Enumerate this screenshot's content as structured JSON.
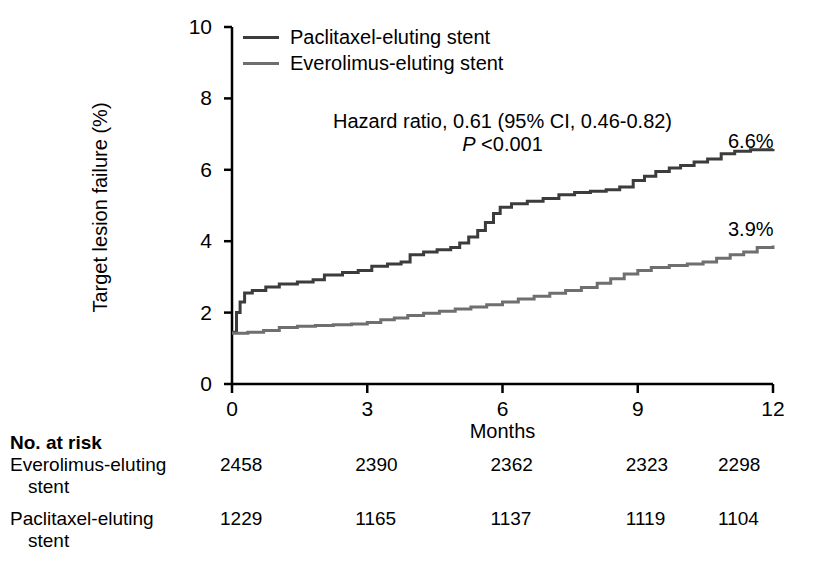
{
  "chart_data": {
    "type": "line",
    "title": "",
    "xlabel": "Months",
    "ylabel": "Target lesion failure (%)",
    "xlim": [
      0,
      12
    ],
    "ylim": [
      0,
      10
    ],
    "xticks": [
      "0",
      "3",
      "6",
      "9",
      "12"
    ],
    "yticks": [
      "0",
      "2",
      "4",
      "6",
      "8",
      "10"
    ],
    "grid": false,
    "legend_position": "top-left",
    "annotations": {
      "hazard_ratio": "Hazard ratio, 0.61 (95% CI, 0.46-0.82)",
      "p_value_italic": "P",
      "p_value_rest": " <0.001"
    },
    "series": [
      {
        "name": "Paclitaxel-eluting stent",
        "color": "#3c3c3c",
        "endpoint_label": "6.6%",
        "endpoint_value": 6.6,
        "points": [
          [
            0.0,
            1.45
          ],
          [
            0.1,
            2.0
          ],
          [
            0.18,
            2.3
          ],
          [
            0.28,
            2.55
          ],
          [
            0.45,
            2.62
          ],
          [
            0.75,
            2.72
          ],
          [
            1.05,
            2.8
          ],
          [
            1.45,
            2.86
          ],
          [
            1.8,
            2.92
          ],
          [
            2.05,
            3.05
          ],
          [
            2.45,
            3.12
          ],
          [
            2.8,
            3.18
          ],
          [
            3.1,
            3.3
          ],
          [
            3.45,
            3.36
          ],
          [
            3.75,
            3.42
          ],
          [
            3.95,
            3.62
          ],
          [
            4.25,
            3.7
          ],
          [
            4.55,
            3.76
          ],
          [
            4.85,
            3.82
          ],
          [
            5.05,
            3.95
          ],
          [
            5.25,
            4.12
          ],
          [
            5.45,
            4.3
          ],
          [
            5.62,
            4.52
          ],
          [
            5.8,
            4.78
          ],
          [
            5.95,
            4.95
          ],
          [
            6.2,
            5.05
          ],
          [
            6.55,
            5.12
          ],
          [
            6.9,
            5.2
          ],
          [
            7.25,
            5.3
          ],
          [
            7.6,
            5.36
          ],
          [
            7.95,
            5.4
          ],
          [
            8.3,
            5.44
          ],
          [
            8.6,
            5.52
          ],
          [
            8.9,
            5.7
          ],
          [
            9.15,
            5.82
          ],
          [
            9.4,
            5.95
          ],
          [
            9.7,
            6.05
          ],
          [
            9.95,
            6.12
          ],
          [
            10.25,
            6.22
          ],
          [
            10.55,
            6.3
          ],
          [
            10.85,
            6.45
          ],
          [
            11.15,
            6.52
          ],
          [
            11.5,
            6.56
          ],
          [
            12.0,
            6.58
          ]
        ]
      },
      {
        "name": "Everolimus-eluting stent",
        "color": "#6f6f6f",
        "endpoint_label": "3.9%",
        "endpoint_value": 3.9,
        "points": [
          [
            0.0,
            1.42
          ],
          [
            0.35,
            1.45
          ],
          [
            0.7,
            1.5
          ],
          [
            1.05,
            1.58
          ],
          [
            1.45,
            1.62
          ],
          [
            1.85,
            1.64
          ],
          [
            2.25,
            1.66
          ],
          [
            2.65,
            1.68
          ],
          [
            3.0,
            1.72
          ],
          [
            3.3,
            1.8
          ],
          [
            3.6,
            1.85
          ],
          [
            3.9,
            1.92
          ],
          [
            4.25,
            1.98
          ],
          [
            4.6,
            2.04
          ],
          [
            4.95,
            2.1
          ],
          [
            5.3,
            2.16
          ],
          [
            5.65,
            2.22
          ],
          [
            6.0,
            2.3
          ],
          [
            6.35,
            2.38
          ],
          [
            6.7,
            2.46
          ],
          [
            7.05,
            2.54
          ],
          [
            7.4,
            2.62
          ],
          [
            7.75,
            2.7
          ],
          [
            8.1,
            2.82
          ],
          [
            8.4,
            2.95
          ],
          [
            8.7,
            3.08
          ],
          [
            9.0,
            3.18
          ],
          [
            9.3,
            3.26
          ],
          [
            9.7,
            3.32
          ],
          [
            10.1,
            3.36
          ],
          [
            10.45,
            3.42
          ],
          [
            10.75,
            3.52
          ],
          [
            11.05,
            3.62
          ],
          [
            11.35,
            3.7
          ],
          [
            11.65,
            3.82
          ],
          [
            12.0,
            3.88
          ]
        ]
      }
    ]
  },
  "risk_table": {
    "title": "No. at risk",
    "column_times": [
      "0",
      "3",
      "6",
      "9",
      "12"
    ],
    "rows": [
      {
        "label_line1": "Everolimus-eluting",
        "label_line2": "stent",
        "values": [
          "2458",
          "2390",
          "2362",
          "2323",
          "2298"
        ]
      },
      {
        "label_line1": "Paclitaxel-eluting",
        "label_line2": "stent",
        "values": [
          "1229",
          "1165",
          "1137",
          "1119",
          "1104"
        ]
      }
    ]
  }
}
